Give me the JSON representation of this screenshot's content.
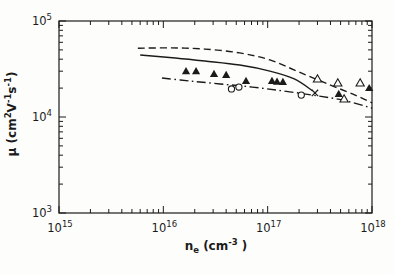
{
  "figure": {
    "background": "#fdfdfb",
    "ink_color": "#1b1b1b"
  },
  "chart_data": {
    "type": "line",
    "title": "",
    "xlabel_segments": [
      {
        "t": "n"
      },
      {
        "t": "e",
        "sub": true
      },
      {
        "t": " (cm"
      },
      {
        "t": "-3",
        "sup": true
      },
      {
        "t": " )"
      }
    ],
    "ylabel_segments": [
      {
        "t": "μ (cm"
      },
      {
        "t": "2",
        "sup": true
      },
      {
        "t": "V"
      },
      {
        "t": "-1",
        "sup": true
      },
      {
        "t": "s"
      },
      {
        "t": "-1",
        "sup": true
      },
      {
        "t": ")"
      }
    ],
    "xlim": [
      1000000000000000.0,
      1e+18
    ],
    "ylim": [
      1000.0,
      100000.0
    ],
    "x_scale": "log",
    "y_scale": "log",
    "grid": false,
    "legend": "none",
    "x_ticks": [
      {
        "base": "10",
        "exp": "15"
      },
      {
        "base": "10",
        "exp": "16"
      },
      {
        "base": "10",
        "exp": "17"
      },
      {
        "base": "10",
        "exp": "18"
      }
    ],
    "y_ticks": [
      {
        "base": "10",
        "exp": "3"
      },
      {
        "base": "10",
        "exp": "4"
      },
      {
        "base": "10",
        "exp": "5"
      }
    ],
    "series": [
      {
        "name": "dashed-curve",
        "kind": "line",
        "style": "dashed",
        "points": [
          [
            5700000000000000.0,
            52000.0
          ],
          [
            1.2e+16,
            52500.0
          ],
          [
            2.5e+16,
            51000.0
          ],
          [
            5.4e+16,
            46500.0
          ],
          [
            1.05e+17,
            39300.0
          ],
          [
            2e+17,
            29400.0
          ],
          [
            4e+17,
            21500.0
          ],
          [
            6.9e+17,
            16900.0
          ],
          [
            1e+18,
            14000.0
          ]
        ]
      },
      {
        "name": "solid-curve",
        "kind": "line",
        "style": "solid",
        "points": [
          [
            6000000000000000.0,
            44300.0
          ],
          [
            1.3e+16,
            41200.0
          ],
          [
            2.5e+16,
            38300.0
          ],
          [
            5.4e+16,
            34800.0
          ],
          [
            1.05e+17,
            30100.0
          ],
          [
            1.8e+17,
            24900.0
          ],
          [
            2.7e+17,
            18700.0
          ]
        ]
      },
      {
        "name": "dashdot-curve",
        "kind": "line",
        "style": "dashdot",
        "points": [
          [
            9700000000000000.0,
            25500.0
          ],
          [
            1.8e+16,
            23700.0
          ],
          [
            3.5e+16,
            22100.0
          ],
          [
            7.1e+16,
            20500.0
          ],
          [
            1.4e+17,
            18700.0
          ],
          [
            2.7e+17,
            16900.0
          ],
          [
            5.2e+17,
            15000.0
          ],
          [
            1e+18,
            12400.0
          ]
        ]
      },
      {
        "name": "filled-triangle-data",
        "kind": "scatter",
        "marker": "triangle-filled",
        "points": [
          [
            1.65e+16,
            30000.0
          ],
          [
            2.06e+16,
            30000.0
          ],
          [
            3.06e+16,
            28000.0
          ],
          [
            4e+16,
            27400.0
          ],
          [
            6.2e+16,
            23700.0
          ],
          [
            1.1e+17,
            23700.0
          ],
          [
            1.23e+17,
            23300.0
          ],
          [
            1.4e+17,
            23200.0
          ],
          [
            4.8e+17,
            17400.0
          ],
          [
            9.4e+17,
            20000.0
          ]
        ]
      },
      {
        "name": "open-triangle-data",
        "kind": "scatter",
        "marker": "triangle-open",
        "points": [
          [
            3e+17,
            24900.0
          ],
          [
            4.7e+17,
            22600.0
          ],
          [
            7.7e+17,
            22600.0
          ],
          [
            5.4e+17,
            15400.0
          ]
        ]
      },
      {
        "name": "open-circle-data",
        "kind": "scatter",
        "marker": "circle-open",
        "points": [
          [
            4.5e+16,
            19600.0
          ],
          [
            5.3e+16,
            20500.0
          ],
          [
            2.1e+17,
            16900.0
          ]
        ]
      },
      {
        "name": "x-marker-data",
        "kind": "scatter",
        "marker": "x",
        "points": [
          [
            2.84e+17,
            17800.0
          ]
        ]
      }
    ]
  }
}
